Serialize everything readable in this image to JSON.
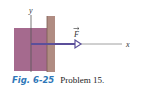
{
  "figure": {
    "axis_y_label": "y",
    "axis_x_label": "x",
    "force_label": "F",
    "colors": {
      "block": "#a56a8e",
      "wall": "#b08c82",
      "force_arrow": "#5b4f9a",
      "axis": "#555555"
    }
  },
  "caption": {
    "figure_number": "Fig. 6-25",
    "text": "Problem 15."
  }
}
